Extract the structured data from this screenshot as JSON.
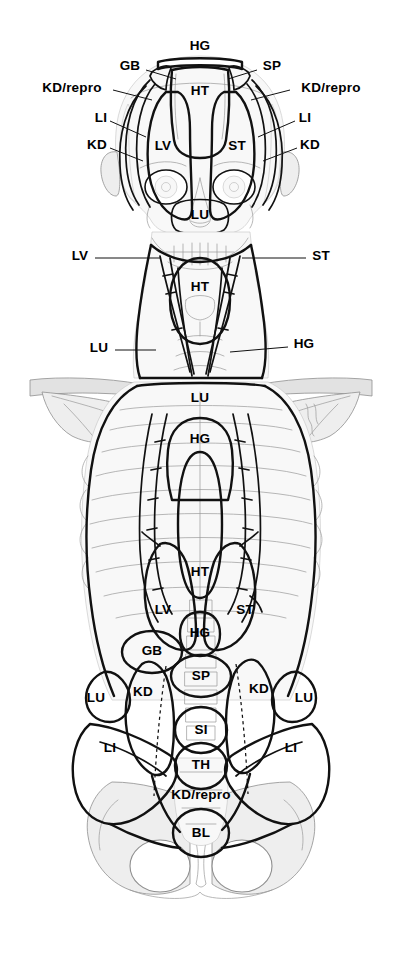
{
  "figure": {
    "background_color": "#ffffff",
    "ink_color": "#000000",
    "shade_light": "#f0f0f0",
    "shade_mid": "#dcdcdc",
    "shade_faint": "#f7f7f7"
  },
  "legend_keys": {
    "HG": "HG",
    "HT": "HT",
    "GB": "GB",
    "SP": "SP",
    "KD": "KD",
    "KD_repro": "KD/repro",
    "LI": "LI",
    "LV": "LV",
    "ST": "ST",
    "LU": "LU",
    "SI": "SI",
    "TH": "TH",
    "BL": "BL"
  },
  "labels": [
    {
      "id": "hg-head-top",
      "text": "HG",
      "x": 200,
      "y": 46,
      "size": "lg",
      "region": "head",
      "leader": null
    },
    {
      "id": "gb-head",
      "text": "GB",
      "x": 130,
      "y": 66,
      "size": "lg",
      "region": "head",
      "leader": {
        "x1": 146,
        "y1": 70,
        "x2": 176,
        "y2": 79
      }
    },
    {
      "id": "sp-head",
      "text": "SP",
      "x": 272,
      "y": 66,
      "size": "lg",
      "region": "head",
      "leader": {
        "x1": 257,
        "y1": 70,
        "x2": 228,
        "y2": 79
      }
    },
    {
      "id": "kdrepro-head-left",
      "text": "KD/repro",
      "x": 72,
      "y": 88,
      "size": "lg",
      "region": "head",
      "leader": {
        "x1": 113,
        "y1": 90,
        "x2": 152,
        "y2": 100
      }
    },
    {
      "id": "kdrepro-head-right",
      "text": "KD/repro",
      "x": 331,
      "y": 88,
      "size": "lg",
      "region": "head",
      "leader": {
        "x1": 290,
        "y1": 90,
        "x2": 251,
        "y2": 100
      }
    },
    {
      "id": "li-head-left",
      "text": "LI",
      "x": 101,
      "y": 118,
      "size": "lg",
      "region": "head",
      "leader": {
        "x1": 110,
        "y1": 121,
        "x2": 146,
        "y2": 137
      }
    },
    {
      "id": "li-head-right",
      "text": "LI",
      "x": 305,
      "y": 118,
      "size": "lg",
      "region": "head",
      "leader": {
        "x1": 295,
        "y1": 121,
        "x2": 258,
        "y2": 137
      }
    },
    {
      "id": "kd-head-left",
      "text": "KD",
      "x": 97,
      "y": 145,
      "size": "lg",
      "region": "head",
      "leader": {
        "x1": 110,
        "y1": 148,
        "x2": 143,
        "y2": 161
      }
    },
    {
      "id": "kd-head-right",
      "text": "KD",
      "x": 310,
      "y": 145,
      "size": "lg",
      "region": "head",
      "leader": {
        "x1": 297,
        "y1": 148,
        "x2": 263,
        "y2": 161
      }
    },
    {
      "id": "ht-head",
      "text": "HT",
      "x": 200,
      "y": 91,
      "size": "lg",
      "region": "head",
      "leader": null
    },
    {
      "id": "lv-head",
      "text": "LV",
      "x": 163,
      "y": 146,
      "size": "lg",
      "region": "head",
      "leader": null
    },
    {
      "id": "st-head",
      "text": "ST",
      "x": 237,
      "y": 146,
      "size": "lg",
      "region": "head",
      "leader": null
    },
    {
      "id": "lu-head",
      "text": "LU",
      "x": 200,
      "y": 215,
      "size": "lg",
      "region": "head",
      "leader": null
    },
    {
      "id": "lv-neck",
      "text": "LV",
      "x": 80,
      "y": 256,
      "size": "lg",
      "region": "neck",
      "leader": {
        "x1": 95,
        "y1": 258,
        "x2": 160,
        "y2": 258
      }
    },
    {
      "id": "st-neck",
      "text": "ST",
      "x": 321,
      "y": 256,
      "size": "lg",
      "region": "neck",
      "leader": {
        "x1": 306,
        "y1": 258,
        "x2": 242,
        "y2": 258
      }
    },
    {
      "id": "ht-neck",
      "text": "HT",
      "x": 200,
      "y": 287,
      "size": "lg",
      "region": "neck",
      "leader": null
    },
    {
      "id": "lu-neck",
      "text": "LU",
      "x": 99,
      "y": 348,
      "size": "lg",
      "region": "neck",
      "leader": {
        "x1": 115,
        "y1": 350,
        "x2": 156,
        "y2": 350
      }
    },
    {
      "id": "hg-neck",
      "text": "HG",
      "x": 304,
      "y": 344,
      "size": "lg",
      "region": "neck",
      "leader": {
        "x1": 288,
        "y1": 347,
        "x2": 230,
        "y2": 352
      }
    },
    {
      "id": "lu-thorax-top",
      "text": "LU",
      "x": 200,
      "y": 398,
      "size": "lg",
      "region": "torso",
      "leader": null
    },
    {
      "id": "hg-thorax",
      "text": "HG",
      "x": 200,
      "y": 439,
      "size": "lg",
      "region": "torso",
      "leader": null
    },
    {
      "id": "ht-thorax",
      "text": "HT",
      "x": 200,
      "y": 572,
      "size": "lg",
      "region": "torso",
      "leader": null
    },
    {
      "id": "lv-thorax",
      "text": "LV",
      "x": 163,
      "y": 610,
      "size": "lg",
      "region": "torso",
      "leader": null
    },
    {
      "id": "st-thorax",
      "text": "ST",
      "x": 245,
      "y": 610,
      "size": "lg",
      "region": "torso",
      "leader": null
    },
    {
      "id": "hg-abdomen",
      "text": "HG",
      "x": 200,
      "y": 633,
      "size": "lg",
      "region": "torso",
      "leader": null
    },
    {
      "id": "gb-abdomen",
      "text": "GB",
      "x": 152,
      "y": 651,
      "size": "lg",
      "region": "torso",
      "leader": null
    },
    {
      "id": "sp-abdomen",
      "text": "SP",
      "x": 201,
      "y": 676,
      "size": "lg",
      "region": "torso",
      "leader": null
    },
    {
      "id": "kd-abdomen-left",
      "text": "KD",
      "x": 143,
      "y": 692,
      "size": "lg",
      "region": "torso",
      "leader": null
    },
    {
      "id": "kd-abdomen-right",
      "text": "KD",
      "x": 259,
      "y": 689,
      "size": "lg",
      "region": "torso",
      "leader": null
    },
    {
      "id": "lu-flank-left",
      "text": "LU",
      "x": 96,
      "y": 698,
      "size": "lg",
      "region": "torso",
      "leader": null
    },
    {
      "id": "lu-flank-right",
      "text": "LU",
      "x": 304,
      "y": 698,
      "size": "lg",
      "region": "torso",
      "leader": null
    },
    {
      "id": "si-abdomen",
      "text": "SI",
      "x": 201,
      "y": 730,
      "size": "lg",
      "region": "torso",
      "leader": null
    },
    {
      "id": "th-abdomen",
      "text": "TH",
      "x": 201,
      "y": 765,
      "size": "lg",
      "region": "torso",
      "leader": null
    },
    {
      "id": "li-pelvis-left",
      "text": "LI",
      "x": 110,
      "y": 748,
      "size": "lg",
      "region": "torso",
      "leader": null
    },
    {
      "id": "li-pelvis-right",
      "text": "LI",
      "x": 291,
      "y": 748,
      "size": "lg",
      "region": "torso",
      "leader": null
    },
    {
      "id": "kdrepro-pelvis",
      "text": "KD/repro",
      "x": 201,
      "y": 795,
      "size": "lg",
      "region": "torso",
      "leader": null
    },
    {
      "id": "bl-pelvis",
      "text": "BL",
      "x": 201,
      "y": 833,
      "size": "lg",
      "region": "torso",
      "leader": null
    }
  ]
}
